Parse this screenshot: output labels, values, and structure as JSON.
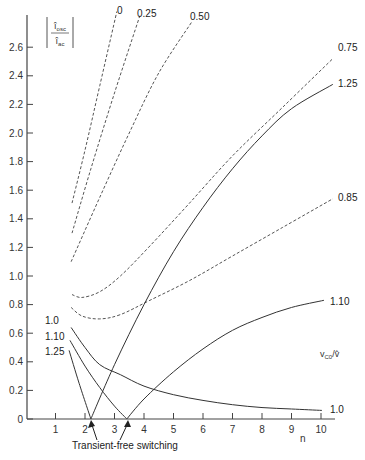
{
  "chart_data": {
    "type": "line",
    "title": "",
    "ylabel": "|î_osc / î_ac|",
    "xlabel": "n",
    "legend_title": "v_C0/v̂",
    "xlim": [
      0,
      10.5
    ],
    "ylim": [
      0,
      2.8
    ],
    "xticks": [
      1,
      2,
      3,
      4,
      5,
      6,
      7,
      8,
      9,
      10
    ],
    "yticks": [
      0,
      0.2,
      0.4,
      0.6,
      0.8,
      1.0,
      1.2,
      1.4,
      1.6,
      1.8,
      2.0,
      2.2,
      2.4,
      2.6
    ],
    "ytick_labels": [
      "0",
      "0.2",
      "0.4",
      "0.6",
      "0.8",
      "1.0",
      "1.2",
      "1.4",
      "1.6",
      "1.8",
      "2.0",
      "2.2",
      "2.4",
      "2.6"
    ],
    "grid": false,
    "annotation": "Transient-free switching",
    "annotation_points": [
      [
        2.2,
        0
      ],
      [
        3.42,
        0
      ]
    ],
    "series": [
      {
        "name": "0",
        "style": "dashed",
        "points": [
          [
            1.56,
            1.51
          ],
          [
            2.0,
            1.88
          ],
          [
            2.5,
            2.33
          ],
          [
            3.08,
            2.85
          ]
        ]
      },
      {
        "name": "0.25",
        "style": "dashed",
        "points": [
          [
            1.56,
            1.3
          ],
          [
            2.2,
            1.75
          ],
          [
            3.0,
            2.28
          ],
          [
            3.86,
            2.82
          ]
        ]
      },
      {
        "name": "0.50",
        "style": "dashed",
        "points": [
          [
            1.53,
            1.1
          ],
          [
            2.5,
            1.55
          ],
          [
            3.5,
            2.0
          ],
          [
            4.5,
            2.42
          ],
          [
            5.63,
            2.78
          ]
        ]
      },
      {
        "name": "0.75",
        "style": "dashed",
        "points": [
          [
            1.56,
            0.87
          ],
          [
            1.9,
            0.85
          ],
          [
            2.5,
            0.89
          ],
          [
            3.2,
            1.0
          ],
          [
            4.2,
            1.21
          ],
          [
            5.5,
            1.5
          ],
          [
            7.0,
            1.84
          ],
          [
            8.7,
            2.18
          ],
          [
            10.4,
            2.52
          ]
        ]
      },
      {
        "name": "0.85",
        "style": "dashed",
        "points": [
          [
            1.53,
            0.78
          ],
          [
            1.9,
            0.72
          ],
          [
            2.5,
            0.7
          ],
          [
            3.2,
            0.73
          ],
          [
            4.2,
            0.83
          ],
          [
            5.56,
            0.97
          ],
          [
            7.0,
            1.14
          ],
          [
            8.7,
            1.34
          ],
          [
            10.4,
            1.54
          ]
        ]
      },
      {
        "name": "1.0",
        "style": "solid",
        "points": [
          [
            1.53,
            0.64
          ],
          [
            2.0,
            0.5
          ],
          [
            2.5,
            0.38
          ],
          [
            3.2,
            0.31
          ],
          [
            4.0,
            0.23
          ],
          [
            5.0,
            0.17
          ],
          [
            6.0,
            0.13
          ],
          [
            7.0,
            0.1
          ],
          [
            8.0,
            0.08
          ],
          [
            9.0,
            0.07
          ],
          [
            10.03,
            0.06
          ]
        ]
      },
      {
        "name": "1.10",
        "style": "solid",
        "points": [
          [
            1.49,
            0.55
          ],
          [
            2.0,
            0.37
          ],
          [
            2.5,
            0.22
          ],
          [
            3.0,
            0.09
          ],
          [
            3.42,
            0
          ],
          [
            4.0,
            0.14
          ],
          [
            5.0,
            0.33
          ],
          [
            6.0,
            0.49
          ],
          [
            7.0,
            0.62
          ],
          [
            8.0,
            0.71
          ],
          [
            9.0,
            0.78
          ],
          [
            10.1,
            0.83
          ]
        ]
      },
      {
        "name": "1.25",
        "style": "solid",
        "points": [
          [
            1.46,
            0.48
          ],
          [
            1.8,
            0.25
          ],
          [
            2.2,
            0
          ],
          [
            3.0,
            0.38
          ],
          [
            4.0,
            0.8
          ],
          [
            5.0,
            1.17
          ],
          [
            6.0,
            1.48
          ],
          [
            7.0,
            1.75
          ],
          [
            8.0,
            1.98
          ],
          [
            9.0,
            2.17
          ],
          [
            10.4,
            2.34
          ]
        ]
      }
    ],
    "labels": [
      {
        "text": "0",
        "x": 117,
        "y": 14
      },
      {
        "text": "0.25",
        "x": 137,
        "y": 17
      },
      {
        "text": "0.50",
        "x": 190,
        "y": 20
      },
      {
        "text": "0.75",
        "x": 338,
        "y": 51
      },
      {
        "text": "1.25",
        "x": 338,
        "y": 87
      },
      {
        "text": "0.85",
        "x": 338,
        "y": 201
      },
      {
        "text": "1.10",
        "x": 330,
        "y": 305
      },
      {
        "text": "1.0",
        "x": 330,
        "y": 413
      },
      {
        "text": "1.0",
        "x": 45,
        "y": 324
      },
      {
        "text": "1.10",
        "x": 45,
        "y": 340
      },
      {
        "text": "1.25",
        "x": 45,
        "y": 355
      }
    ]
  }
}
